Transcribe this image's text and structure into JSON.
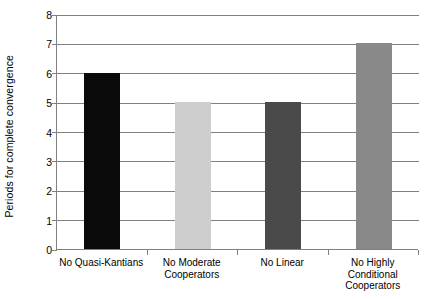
{
  "chart_data": {
    "type": "bar",
    "title": "",
    "xlabel": "",
    "ylabel": "Periods for complete convergence",
    "ylim": [
      0,
      8
    ],
    "yticks": [
      "0",
      "1",
      "2",
      "3",
      "4",
      "5",
      "6",
      "7",
      "8"
    ],
    "grid": true,
    "legend": "none",
    "categories": [
      "No Quasi-Kantians",
      "No Moderate Cooperators",
      "No Linear",
      "No Highly Conditional Cooperators"
    ],
    "category_lines": [
      [
        "No Quasi-Kantians"
      ],
      [
        "No Moderate",
        "Cooperators"
      ],
      [
        "No Linear"
      ],
      [
        "No Highly",
        "Conditional",
        "Cooperators"
      ]
    ],
    "values": [
      6,
      5,
      5,
      7
    ],
    "bar_colors": [
      "#0a0a0a",
      "#cdcdcd",
      "#4a4a4a",
      "#898989"
    ]
  },
  "axes": {
    "y_title": "Periods for complete convergence"
  }
}
